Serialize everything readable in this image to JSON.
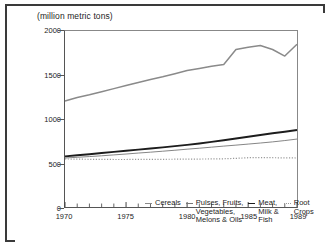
{
  "figure": {
    "title": "(million metric tons)",
    "frame_color": "#3a3a3a"
  },
  "chart_data": {
    "type": "line",
    "title": "(million metric tons)",
    "xlabel": "",
    "ylabel": "(million metric tons)",
    "xlim": [
      1970,
      1989
    ],
    "ylim": [
      0,
      2000
    ],
    "grid": false,
    "legend_position": "inside-bottom",
    "x": [
      1970,
      1971,
      1972,
      1973,
      1974,
      1975,
      1976,
      1977,
      1978,
      1979,
      1980,
      1981,
      1982,
      1983,
      1984,
      1985,
      1986,
      1987,
      1988,
      1989
    ],
    "y_ticks": [
      0,
      500,
      1000,
      1500,
      2000
    ],
    "y_tick_labels": [
      "0",
      "500",
      "1000",
      "1500",
      "2000"
    ],
    "x_ticks": [
      1970,
      1975,
      1980,
      1985,
      1989
    ],
    "x_tick_labels": [
      "1970",
      "1975",
      "1980",
      "1985",
      "1989"
    ],
    "x_minor_ticks": [
      1971,
      1972,
      1973,
      1974,
      1976,
      1977,
      1978,
      1979,
      1981,
      1982,
      1983,
      1984,
      1986,
      1987,
      1988
    ],
    "series": [
      {
        "name": "Cereals",
        "color": "#8a8a8a",
        "style": "solid",
        "width": 1.5,
        "values": [
          1205,
          1245,
          1275,
          1310,
          1345,
          1380,
          1415,
          1450,
          1480,
          1515,
          1550,
          1575,
          1600,
          1620,
          1790,
          1815,
          1835,
          1790,
          1715,
          1850
        ]
      },
      {
        "name": "Pulses, Fruits,\nVegetables,\nMelons & Oils",
        "color": "#777777",
        "style": "solid",
        "width": 0.9,
        "values": [
          557,
          565,
          573,
          582,
          592,
          602,
          613,
          623,
          634,
          645,
          657,
          668,
          680,
          692,
          703,
          715,
          727,
          740,
          755,
          772
        ]
      },
      {
        "name": "Meat,\nMilk &\nFish",
        "color": "#1d1d1d",
        "style": "solid",
        "width": 1.9,
        "values": [
          575,
          588,
          600,
          613,
          626,
          639,
          652,
          665,
          678,
          692,
          706,
          722,
          740,
          758,
          778,
          798,
          818,
          838,
          855,
          875
        ]
      },
      {
        "name": "Root\nCrops",
        "color": "#999999",
        "style": "dotted",
        "width": 1.2,
        "values": [
          546,
          544,
          542,
          541,
          540,
          540,
          541,
          541,
          542,
          543,
          544,
          545,
          546,
          548,
          553,
          560,
          562,
          560,
          558,
          557
        ]
      }
    ]
  },
  "legend": {
    "entries": [
      {
        "label": "Cereals",
        "marker": "solid-gray"
      },
      {
        "label": "Pulses, Fruits,\nVegetables,\nMelons & Oils",
        "marker": "thin-gray"
      },
      {
        "label": "Meat,\nMilk &\nFish",
        "marker": "bold-dark"
      },
      {
        "label": "Root\nCrops",
        "marker": "dotted"
      }
    ]
  }
}
